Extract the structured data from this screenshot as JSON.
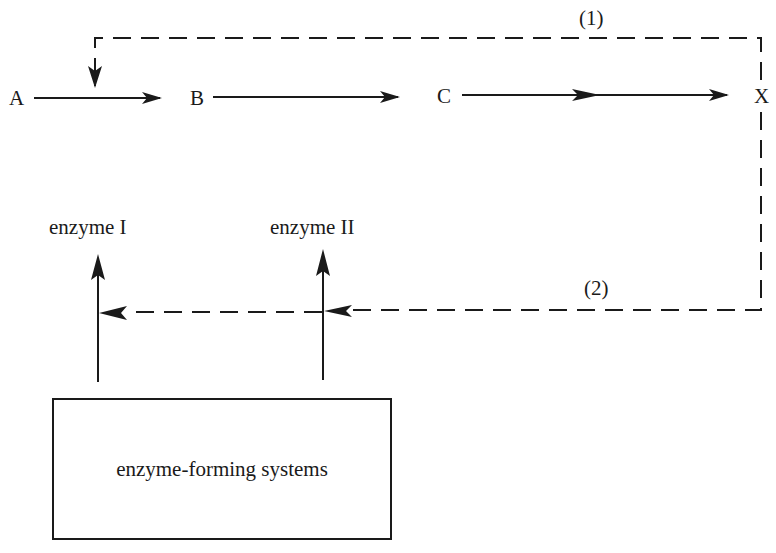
{
  "diagram": {
    "nodes": [
      {
        "id": "A",
        "label": "A"
      },
      {
        "id": "B",
        "label": "B"
      },
      {
        "id": "C",
        "label": "C"
      },
      {
        "id": "X",
        "label": "X"
      }
    ],
    "pathway_edges": [
      {
        "from": "A",
        "to": "B",
        "style": "solid"
      },
      {
        "from": "B",
        "to": "C",
        "style": "solid"
      },
      {
        "from": "C",
        "to": "X",
        "style": "solid"
      }
    ],
    "feedback_loops": [
      {
        "label": "(1)",
        "from": "X",
        "to": "A→B step",
        "style": "dashed"
      },
      {
        "label": "(2)",
        "from": "X",
        "to": "enzyme I, enzyme II",
        "style": "dashed"
      }
    ],
    "enzymes": [
      {
        "label": "enzyme I"
      },
      {
        "label": "enzyme II"
      }
    ],
    "source_box": {
      "label": "enzyme-forming systems"
    }
  }
}
